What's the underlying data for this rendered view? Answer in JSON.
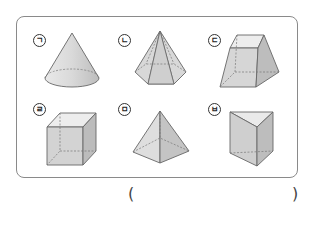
{
  "figures": [
    {
      "label": "ㄱ",
      "shape": "cone"
    },
    {
      "label": "ㄴ",
      "shape": "hexagonal-pyramid"
    },
    {
      "label": "ㄷ",
      "shape": "square-frustum"
    },
    {
      "label": "ㄹ",
      "shape": "cube"
    },
    {
      "label": "ㅁ",
      "shape": "square-pyramid"
    },
    {
      "label": "ㅂ",
      "shape": "triangular-prism"
    }
  ],
  "answer": {
    "open": "(",
    "close": ")",
    "value": ""
  }
}
